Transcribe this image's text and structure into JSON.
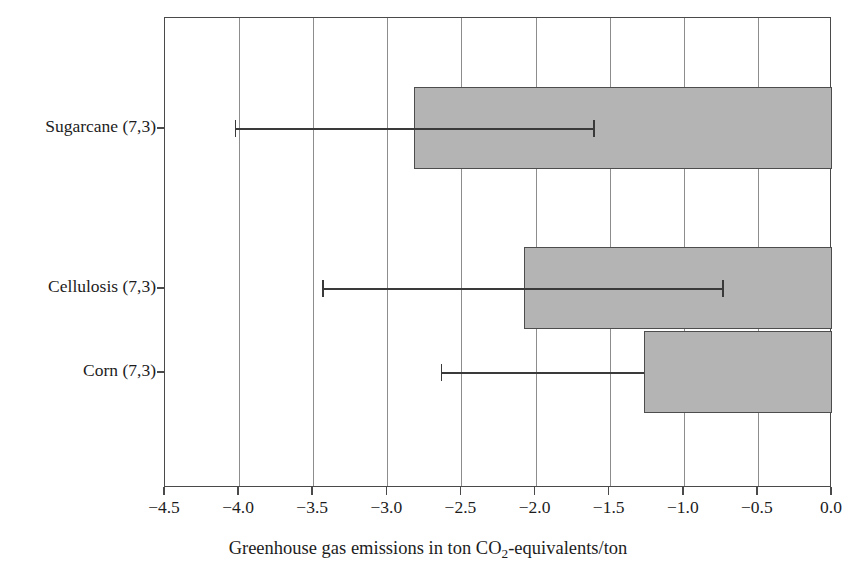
{
  "chart_data": {
    "type": "bar",
    "orientation": "horizontal",
    "title": "",
    "subtitle": "",
    "xlabel_parts": {
      "before": "Greenhouse gas emissions in ton CO",
      "subscript": "2",
      "after": "-equivalents/ton"
    },
    "xlabel": "Greenhouse gas emissions in ton CO2-equivalents/ton",
    "ylabel": "",
    "categories": [
      "Sugarcane (7,3)",
      "Cellulosis (7,3)",
      "Corn (7,3)"
    ],
    "values": [
      -2.82,
      -2.08,
      -1.27
    ],
    "error_low": [
      -4.03,
      -3.44,
      -2.64
    ],
    "error_high": [
      -1.61,
      -0.74,
      -1.27
    ],
    "xlim": [
      -4.5,
      0.0
    ],
    "xticks": [
      -4.5,
      -4.0,
      -3.5,
      -3.0,
      -2.5,
      -2.0,
      -1.5,
      -1.0,
      -0.5,
      0.0
    ],
    "xticklabels": [
      "−4.5",
      "−4.0",
      "−3.5",
      "−3.0",
      "−2.5",
      "−2.0",
      "−1.5",
      "−1.0",
      "−0.5",
      "0.0"
    ],
    "grid": true,
    "grid_axis": "x",
    "legend": false,
    "legend_position": "none",
    "bar_color": "#b4b4b4",
    "bar_edge_color": "#4d4d4d",
    "error_color": "#3a3a3a",
    "axis_color": "#4a4a4a",
    "grid_color": "#8d8d8d",
    "background_color": "#ffffff"
  },
  "geometry": {
    "plot_left": 164,
    "plot_right": 831,
    "plot_top": 17,
    "plot_bottom": 487,
    "bars": [
      {
        "name": "Sugarcane (7,3)",
        "top": 86,
        "height": 82,
        "center_y": 127,
        "bar_left_px": 413,
        "err_left_px": 234,
        "err_right_px": 592
      },
      {
        "name": "Cellulosis (7,3)",
        "top": 246,
        "height": 82,
        "center_y": 287,
        "bar_left_px": 523,
        "err_left_px": 320,
        "err_right_px": 722
      },
      {
        "name": "Corn (7,3)",
        "top": 330,
        "height": 82,
        "center_y": 371,
        "bar_left_px": 643,
        "err_left_px": 442,
        "err_right_px": 643
      }
    ],
    "ytick_y": [
      127,
      287,
      371
    ],
    "xtick_x": [
      164,
      238,
      312,
      386,
      460,
      534,
      608,
      683,
      757,
      831
    ]
  }
}
